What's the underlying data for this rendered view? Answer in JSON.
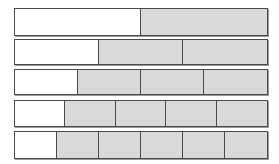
{
  "figure": {
    "bar_left_px": 14,
    "bar_width_px": 254,
    "colors": {
      "shaded_fill": "#d9d9d9",
      "unshaded_fill": "#ffffff",
      "border": "#4a4a4a",
      "shadow": "#9a9a9a",
      "background": "#ffffff"
    }
  },
  "chart_data": {
    "type": "bar",
    "xlabel": "",
    "ylabel": "",
    "categories": [
      "1/2",
      "1/3",
      "1/4",
      "1/5",
      "1/6"
    ],
    "values": [
      2,
      3,
      4,
      5,
      6
    ],
    "legend": [],
    "grid": false,
    "bars": [
      {
        "label": "1/2",
        "parts": 2,
        "unshaded_parts": 1,
        "shaded_parts": 1,
        "fraction_unshaded": "1/2",
        "top_px": 8,
        "height_px": 28,
        "segments": [
          {
            "state": "unshaded",
            "percent": 50
          },
          {
            "state": "shaded",
            "percent": 50
          }
        ]
      },
      {
        "label": "1/3",
        "parts": 3,
        "unshaded_parts": 1,
        "shaded_parts": 2,
        "fraction_unshaded": "1/3",
        "top_px": 39,
        "height_px": 26,
        "segments": [
          {
            "state": "unshaded",
            "percent": 33.33
          },
          {
            "state": "shaded",
            "percent": 33.33
          },
          {
            "state": "shaded",
            "percent": 33.34
          }
        ]
      },
      {
        "label": "1/4",
        "parts": 4,
        "unshaded_parts": 1,
        "shaded_parts": 3,
        "fraction_unshaded": "1/4",
        "top_px": 69,
        "height_px": 26,
        "segments": [
          {
            "state": "unshaded",
            "percent": 25
          },
          {
            "state": "shaded",
            "percent": 25
          },
          {
            "state": "shaded",
            "percent": 25
          },
          {
            "state": "shaded",
            "percent": 25
          }
        ]
      },
      {
        "label": "1/5",
        "parts": 5,
        "unshaded_parts": 1,
        "shaded_parts": 4,
        "fraction_unshaded": "1/5",
        "top_px": 100,
        "height_px": 27,
        "segments": [
          {
            "state": "unshaded",
            "percent": 20
          },
          {
            "state": "shaded",
            "percent": 20
          },
          {
            "state": "shaded",
            "percent": 20
          },
          {
            "state": "shaded",
            "percent": 20
          },
          {
            "state": "shaded",
            "percent": 20
          }
        ]
      },
      {
        "label": "1/6",
        "parts": 6,
        "unshaded_parts": 1,
        "shaded_parts": 5,
        "fraction_unshaded": "1/6",
        "top_px": 131,
        "height_px": 28,
        "segments": [
          {
            "state": "unshaded",
            "percent": 16.666
          },
          {
            "state": "shaded",
            "percent": 16.666
          },
          {
            "state": "shaded",
            "percent": 16.666
          },
          {
            "state": "shaded",
            "percent": 16.666
          },
          {
            "state": "shaded",
            "percent": 16.668
          },
          {
            "state": "shaded",
            "percent": 16.668
          }
        ]
      }
    ]
  }
}
